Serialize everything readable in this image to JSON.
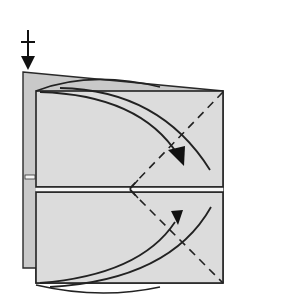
{
  "diagram": {
    "type": "origami-fold-step",
    "colors": {
      "background": "#ffffff",
      "back_layer": "#c8c8c8",
      "front_panel": "#dedede",
      "outline": "#222222",
      "slit": "#f4f4f4"
    },
    "symbols": [
      {
        "name": "push-down-arrow-icon",
        "meaning": "press/push in at top-left corner"
      },
      {
        "name": "valley-fold-dashed-line",
        "count": 2
      },
      {
        "name": "fold-arrow-icon",
        "count": 2
      }
    ]
  }
}
